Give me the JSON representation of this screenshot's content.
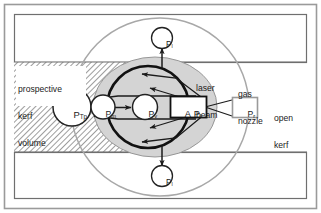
{
  "figure": {
    "type": "technical-diagram"
  },
  "regions": {
    "prospective_kerf": {
      "label_line1": "prospective",
      "label_line2": "kerf",
      "label_line3": "volume",
      "fill": "hatched-gray"
    },
    "open_kerf": {
      "label_line1": "open",
      "label_line2": "kerf",
      "fill": "#ffffff"
    }
  },
  "annotations": {
    "laser_beam_line1": "laser",
    "laser_beam_line2": "beam",
    "gas_nozzle_line1": "gas",
    "gas_nozzle_line2": "nozzle"
  },
  "nodes": {
    "p_tp": {
      "base": "P",
      "sub": "Tp",
      "shape": "circle"
    },
    "p_m": {
      "base": "P",
      "sub": "m",
      "shape": "circle"
    },
    "p_v": {
      "base": "P",
      "sub": "v",
      "shape": "circle"
    },
    "p_l_top": {
      "base": "P",
      "sub": "l",
      "shape": "circle"
    },
    "p_l_bottom": {
      "base": "P",
      "sub": "l",
      "shape": "circle"
    },
    "p_r": {
      "base": "P",
      "sub": "r",
      "shape": "rect"
    },
    "absorbed_power": {
      "prefix": "A",
      "base": "P",
      "sub": "L",
      "shape": "rect"
    }
  },
  "colors": {
    "frame": "#9a9a9a",
    "band_border": "#6f6f6f",
    "hatch": "#8c8c8c",
    "melt_fill": "#d4d4d4",
    "nozzle_circle": "#a8a8a8",
    "beam_circle": "#111111",
    "node_fill": "#ffffff",
    "node_stroke": "#222222",
    "pr_stroke": "#9a9a9a",
    "arrow": "#1b1b1b",
    "text": "#1b1b1b"
  }
}
